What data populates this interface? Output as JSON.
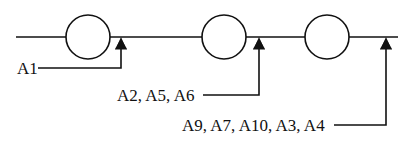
{
  "diagram": {
    "type": "serial-line-with-stations",
    "colors": {
      "stroke": "#111111",
      "background": "#ffffff"
    },
    "stations": [
      {
        "id": "station-1",
        "shape": "circle"
      },
      {
        "id": "station-2",
        "shape": "circle"
      },
      {
        "id": "station-3",
        "shape": "circle"
      }
    ],
    "inputs": [
      {
        "label": "A1",
        "target": "after station-1"
      },
      {
        "label": "A2, A5, A6",
        "target": "after station-2"
      },
      {
        "label": "A9, A7, A10, A3, A4",
        "target": "after station-3"
      }
    ]
  }
}
